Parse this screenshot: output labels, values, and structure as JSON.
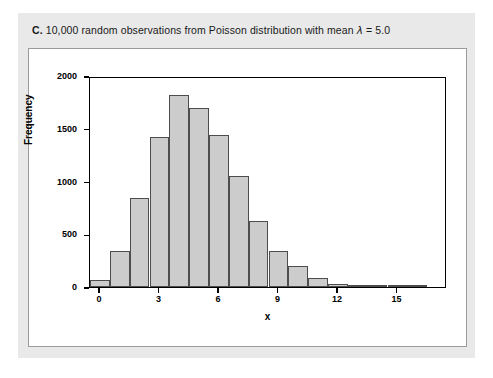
{
  "caption": {
    "letter": "C.",
    "text": "10,000 random observations from Poisson distribution with mean ",
    "lambda": "λ",
    "equals": " = 5.0"
  },
  "chart_data": {
    "type": "bar",
    "title": "",
    "subtitle": "",
    "xlabel": "x",
    "ylabel": "Frequency",
    "categories": [
      0,
      1,
      2,
      3,
      4,
      5,
      6,
      7,
      8,
      9,
      10,
      11,
      12,
      13,
      14,
      15,
      16,
      17
    ],
    "values": [
      70,
      340,
      840,
      1420,
      1820,
      1700,
      1440,
      1050,
      630,
      340,
      200,
      85,
      25,
      10,
      5,
      2,
      1,
      0
    ],
    "xlim": [
      -0.5,
      17.5
    ],
    "ylim": [
      0,
      2000
    ],
    "xticks": [
      0,
      3,
      6,
      9,
      12,
      15
    ],
    "xticklabels": [
      "0",
      "3",
      "6",
      "9",
      "12",
      "15"
    ],
    "yticks": [
      0,
      500,
      1000,
      1500,
      2000
    ],
    "yticklabels": [
      "0",
      "500",
      "1000",
      "1500",
      "2000"
    ],
    "grid": false,
    "legend": false,
    "bar_color": "#cccccc",
    "bar_edge_color": "#4d4d4d",
    "frame_color": "#000000",
    "panel_color": "#e9e9e9",
    "plot_bg": "#ffffff"
  }
}
